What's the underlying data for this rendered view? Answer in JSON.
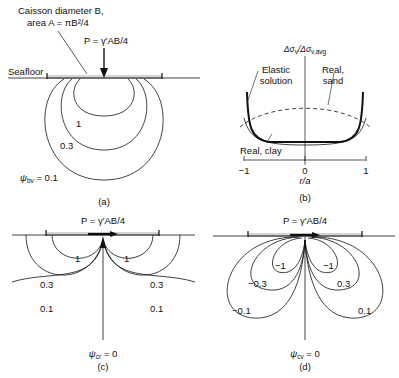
{
  "panel_a": {
    "caisson_label_line1": "Caisson diameter B,",
    "caisson_label_line2": "area A = πB²/4",
    "load_label": "P = γ′AB/4",
    "seafloor_label": "Seafloor",
    "contour_labels": [
      "1",
      "0.3"
    ],
    "psi_label": "ψ",
    "psi_sub": "bv",
    "psi_value": " = 0.1",
    "caption": "(a)"
  },
  "panel_b": {
    "y_axis_label": "Δσ",
    "y_axis_sub1": "v",
    "y_axis_mid": "/Δσ",
    "y_axis_sub2": "v,avg",
    "elastic_label_line1": "Elastic",
    "elastic_label_line2": "solution",
    "sand_label_line1": "Real,",
    "sand_label_line2": "sand",
    "clay_label": "Real, clay",
    "x_ticks": [
      "−1",
      "0",
      "1"
    ],
    "x_axis_label": "r/a",
    "caption": "(b)"
  },
  "panel_c": {
    "load_label": "P = γ′AB/4",
    "left_labels": [
      "1",
      "0.3",
      "0.1"
    ],
    "right_labels": [
      "1",
      "0.3",
      "0.1"
    ],
    "psi_label": "ψ",
    "psi_sub": "cr",
    "psi_value": " = 0",
    "caption": "(c)"
  },
  "panel_d": {
    "load_label": "P = γ′AB/4",
    "left_labels": [
      "−1",
      "−0.3",
      "−0.1"
    ],
    "right_labels": [
      "−1",
      "0.3",
      "0.1"
    ],
    "psi_label": "ψ",
    "psi_sub": "cv",
    "psi_value": " = 0",
    "caption": "(d)"
  }
}
